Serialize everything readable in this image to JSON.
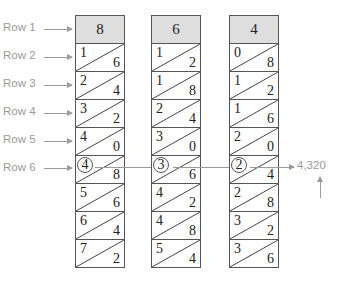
{
  "row_labels": [
    "Row 1",
    "Row 2",
    "Row 3",
    "Row 4",
    "Row 5",
    "Row 6"
  ],
  "rods": [
    {
      "header": "8",
      "cells": [
        {
          "tens": "1",
          "ones": "6"
        },
        {
          "tens": "2",
          "ones": "4"
        },
        {
          "tens": "3",
          "ones": "2"
        },
        {
          "tens": "4",
          "ones": "0"
        },
        {
          "tens": "4",
          "ones": "8"
        },
        {
          "tens": "5",
          "ones": "6"
        },
        {
          "tens": "6",
          "ones": "4"
        },
        {
          "tens": "7",
          "ones": "2"
        }
      ]
    },
    {
      "header": "6",
      "cells": [
        {
          "tens": "1",
          "ones": "2"
        },
        {
          "tens": "1",
          "ones": "8"
        },
        {
          "tens": "2",
          "ones": "4"
        },
        {
          "tens": "3",
          "ones": "0"
        },
        {
          "tens": "3",
          "ones": "6"
        },
        {
          "tens": "4",
          "ones": "2"
        },
        {
          "tens": "4",
          "ones": "8"
        },
        {
          "tens": "5",
          "ones": "4"
        }
      ]
    },
    {
      "header": "4",
      "cells": [
        {
          "tens": "0",
          "ones": "8"
        },
        {
          "tens": "1",
          "ones": "2"
        },
        {
          "tens": "1",
          "ones": "6"
        },
        {
          "tens": "2",
          "ones": "0"
        },
        {
          "tens": "2",
          "ones": "4"
        },
        {
          "tens": "2",
          "ones": "8"
        },
        {
          "tens": "3",
          "ones": "2"
        },
        {
          "tens": "3",
          "ones": "6"
        }
      ]
    }
  ],
  "highlighted_row_index": 4,
  "result": "4,320",
  "colors": {
    "annotation": "#9a9a9a",
    "header_fill": "#dedede",
    "border": "#555555"
  }
}
